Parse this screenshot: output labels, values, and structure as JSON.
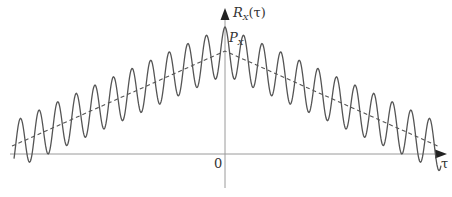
{
  "diagram": {
    "y_axis": {
      "label_main": "R",
      "label_sub": "X",
      "label_arg": "(τ)"
    },
    "x_axis": {
      "label": "τ"
    },
    "origin_label": "0",
    "peak_label": {
      "main": "P",
      "sub": "X"
    },
    "colors": {
      "curve": "#555555",
      "axis": "#888888",
      "dashed": "#555555",
      "text": "#333333"
    },
    "geometry": {
      "origin_x": 225,
      "axis_y": 154,
      "peak_solid_y": 27,
      "peak_dashed_y": 51,
      "dashed_end_y": 147,
      "x_left": 12,
      "x_right": 440,
      "period_px": 18.6,
      "amplitude_px": 24
    }
  }
}
